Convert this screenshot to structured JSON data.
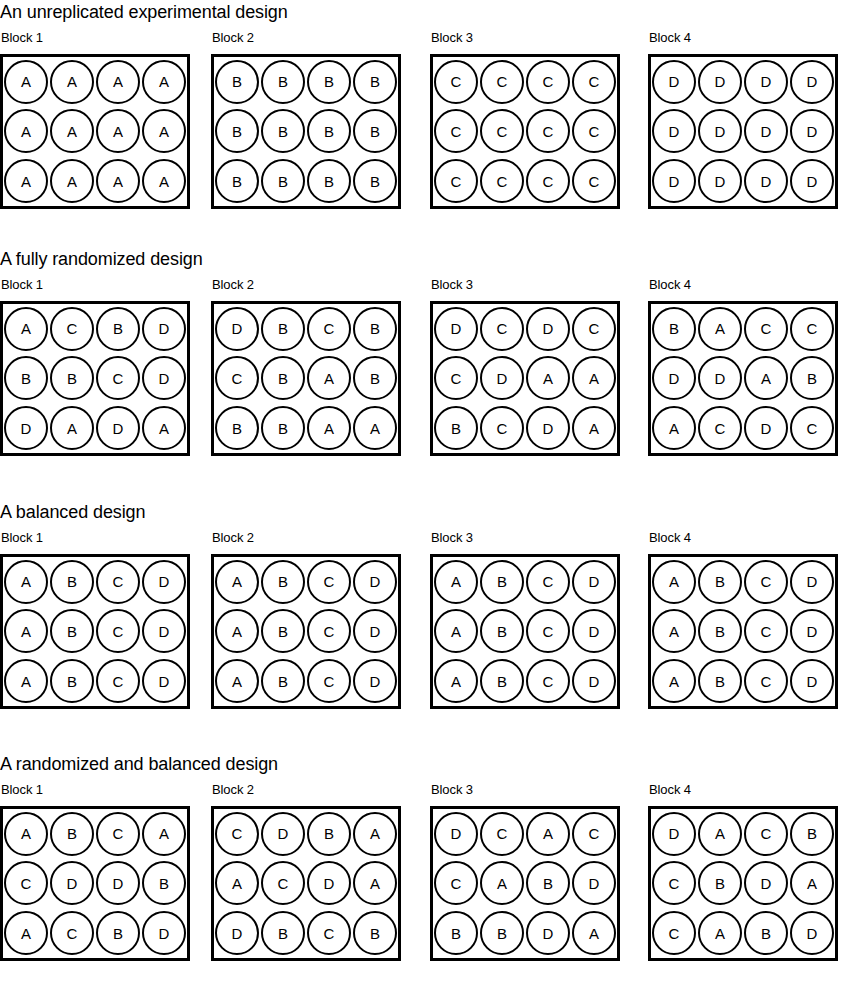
{
  "figure": {
    "title_a": "An unreplicated experimental design",
    "title_b": "A fully randomized design",
    "title_c": "A balanced design",
    "title_d": "A randomized and balanced design"
  },
  "block_labels": {
    "b1": "Block 1",
    "b2": "Block 2",
    "b3": "Block 3",
    "b4": "Block 4"
  },
  "treatments": [
    "A",
    "B",
    "C",
    "D"
  ],
  "chart_data": {
    "type": "diagram",
    "rows_per_block": 3,
    "cols_per_block": 4,
    "blocks_per_section": 4,
    "sections": [
      {
        "title": "An unreplicated experimental design",
        "blocks": [
          {
            "label": "Block 1",
            "rows": [
              [
                "A",
                "A",
                "A",
                "A"
              ],
              [
                "A",
                "A",
                "A",
                "A"
              ],
              [
                "A",
                "A",
                "A",
                "A"
              ]
            ]
          },
          {
            "label": "Block 2",
            "rows": [
              [
                "B",
                "B",
                "B",
                "B"
              ],
              [
                "B",
                "B",
                "B",
                "B"
              ],
              [
                "B",
                "B",
                "B",
                "B"
              ]
            ]
          },
          {
            "label": "Block 3",
            "rows": [
              [
                "C",
                "C",
                "C",
                "C"
              ],
              [
                "C",
                "C",
                "C",
                "C"
              ],
              [
                "C",
                "C",
                "C",
                "C"
              ]
            ]
          },
          {
            "label": "Block 4",
            "rows": [
              [
                "D",
                "D",
                "D",
                "D"
              ],
              [
                "D",
                "D",
                "D",
                "D"
              ],
              [
                "D",
                "D",
                "D",
                "D"
              ]
            ]
          }
        ]
      },
      {
        "title": "A fully randomized design",
        "blocks": [
          {
            "label": "Block 1",
            "rows": [
              [
                "A",
                "C",
                "B",
                "D"
              ],
              [
                "B",
                "B",
                "C",
                "D"
              ],
              [
                "D",
                "A",
                "D",
                "A"
              ]
            ]
          },
          {
            "label": "Block 2",
            "rows": [
              [
                "D",
                "B",
                "C",
                "B"
              ],
              [
                "C",
                "B",
                "A",
                "B"
              ],
              [
                "B",
                "B",
                "A",
                "A"
              ]
            ]
          },
          {
            "label": "Block 3",
            "rows": [
              [
                "D",
                "C",
                "D",
                "C"
              ],
              [
                "C",
                "D",
                "A",
                "A"
              ],
              [
                "B",
                "C",
                "D",
                "A"
              ]
            ]
          },
          {
            "label": "Block 4",
            "rows": [
              [
                "B",
                "A",
                "C",
                "C"
              ],
              [
                "D",
                "D",
                "A",
                "B"
              ],
              [
                "A",
                "C",
                "D",
                "C"
              ]
            ]
          }
        ]
      },
      {
        "title": "A balanced design",
        "blocks": [
          {
            "label": "Block 1",
            "rows": [
              [
                "A",
                "B",
                "C",
                "D"
              ],
              [
                "A",
                "B",
                "C",
                "D"
              ],
              [
                "A",
                "B",
                "C",
                "D"
              ]
            ]
          },
          {
            "label": "Block 2",
            "rows": [
              [
                "A",
                "B",
                "C",
                "D"
              ],
              [
                "A",
                "B",
                "C",
                "D"
              ],
              [
                "A",
                "B",
                "C",
                "D"
              ]
            ]
          },
          {
            "label": "Block 3",
            "rows": [
              [
                "A",
                "B",
                "C",
                "D"
              ],
              [
                "A",
                "B",
                "C",
                "D"
              ],
              [
                "A",
                "B",
                "C",
                "D"
              ]
            ]
          },
          {
            "label": "Block 4",
            "rows": [
              [
                "A",
                "B",
                "C",
                "D"
              ],
              [
                "A",
                "B",
                "C",
                "D"
              ],
              [
                "A",
                "B",
                "C",
                "D"
              ]
            ]
          }
        ]
      },
      {
        "title": "A randomized and balanced design",
        "blocks": [
          {
            "label": "Block 1",
            "rows": [
              [
                "A",
                "B",
                "C",
                "A"
              ],
              [
                "C",
                "D",
                "D",
                "B"
              ],
              [
                "A",
                "C",
                "B",
                "D"
              ]
            ]
          },
          {
            "label": "Block 2",
            "rows": [
              [
                "C",
                "D",
                "B",
                "A"
              ],
              [
                "A",
                "C",
                "D",
                "A"
              ],
              [
                "D",
                "B",
                "C",
                "B"
              ]
            ]
          },
          {
            "label": "Block 3",
            "rows": [
              [
                "D",
                "C",
                "A",
                "C"
              ],
              [
                "C",
                "A",
                "B",
                "D"
              ],
              [
                "B",
                "B",
                "D",
                "A"
              ]
            ]
          },
          {
            "label": "Block 4",
            "rows": [
              [
                "D",
                "A",
                "C",
                "B"
              ],
              [
                "C",
                "B",
                "D",
                "A"
              ],
              [
                "C",
                "A",
                "B",
                "D"
              ]
            ]
          }
        ]
      }
    ]
  }
}
